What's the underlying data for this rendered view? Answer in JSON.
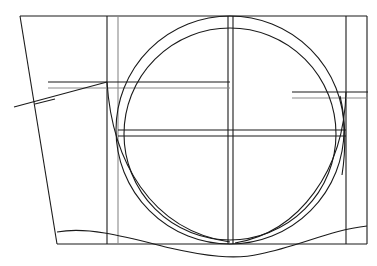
{
  "diagram": {
    "type": "technical line drawing",
    "colors": {
      "line": "#1a1a1a",
      "guide": "#8a8a8a",
      "background": "#ffffff"
    },
    "frame": {
      "top_y": 16,
      "bottom_y": 244,
      "left_slant": {
        "x1": 20,
        "y1": 16,
        "x2": 57,
        "y2": 244
      },
      "verticals_x": [
        107,
        118,
        228,
        233,
        346,
        367
      ]
    },
    "circles": [
      {
        "name": "outer",
        "cx": 230,
        "cy": 130,
        "r": 114
      },
      {
        "name": "inner",
        "cx": 230,
        "cy": 134,
        "r": 106
      }
    ],
    "horizontals": [
      {
        "y": 82,
        "x1": 48,
        "x2": 230
      },
      {
        "y": 88,
        "x1": 48,
        "x2": 230
      },
      {
        "y": 92,
        "x1": 292,
        "x2": 368
      },
      {
        "y": 98,
        "x1": 292,
        "x2": 368
      },
      {
        "y": 130,
        "x1": 118,
        "x2": 346
      },
      {
        "y": 136,
        "x1": 118,
        "x2": 346
      }
    ],
    "leader_line": {
      "from": [
        14,
        107
      ],
      "to": [
        107,
        82
      ]
    },
    "top_label_cut_off": ""
  }
}
